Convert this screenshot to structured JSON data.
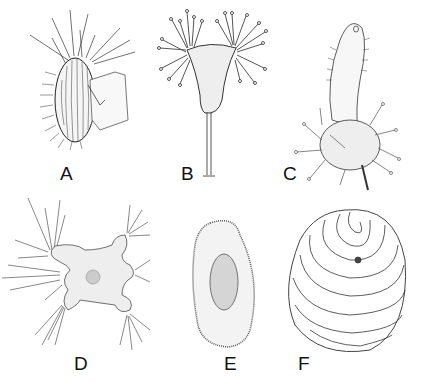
{
  "figure": {
    "panels": [
      {
        "id": "A",
        "label": "A",
        "description": "ovoid ciliated cell with striations, long radiating spines, and a lorica/cup attached on right"
      },
      {
        "id": "B",
        "label": "B",
        "description": "stalked triangular body with capitate tentacles in two tufts"
      },
      {
        "id": "C",
        "label": "C",
        "description": "ciliated elongated cell emerging from round body bearing capitate tentacles"
      },
      {
        "id": "D",
        "label": "D",
        "description": "lobed amoeboid body with central nucleus and tufts of radiating tentacles"
      },
      {
        "id": "E",
        "label": "E",
        "description": "elongated oval ciliated cell with dotted surface and elongated macronucleus"
      },
      {
        "id": "F",
        "label": "F",
        "description": "rounded ciliate with spiral/concentric ciliary rows and marginal cilia"
      }
    ]
  },
  "colors": {
    "ink": "#222222",
    "fill": "#eeeeee",
    "background": "#ffffff"
  }
}
